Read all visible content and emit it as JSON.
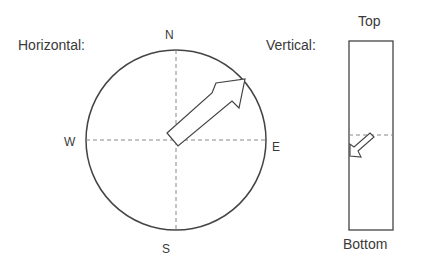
{
  "horizontal": {
    "title": "Horizontal:",
    "directions": {
      "north": "N",
      "south": "S",
      "east": "E",
      "west": "W"
    },
    "arrow_heading_deg": 45
  },
  "vertical": {
    "title": "Vertical:",
    "top_label": "Top",
    "bottom_label": "Bottom",
    "arrow": "pointing down-left, below center line"
  },
  "colors": {
    "stroke": "#444444",
    "dashed": "#888888",
    "text": "#3a3a3a"
  }
}
